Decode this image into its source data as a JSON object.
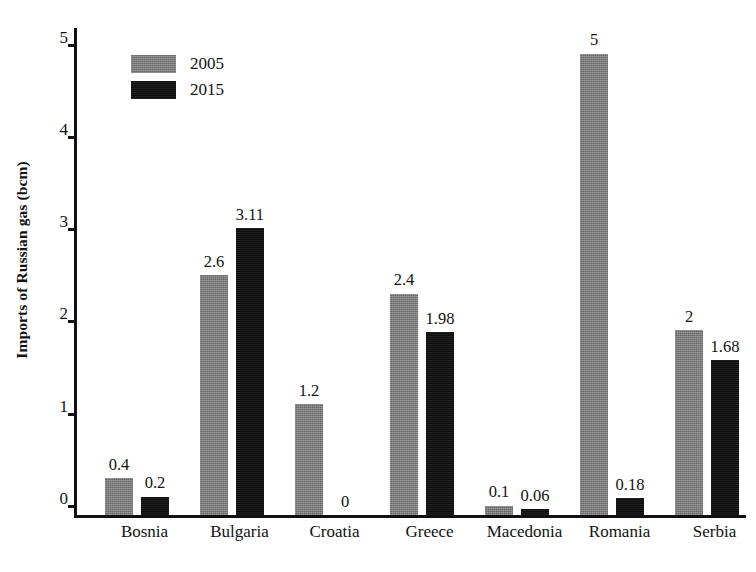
{
  "chart_data": {
    "type": "bar",
    "title": "",
    "subtitle": "",
    "xlabel": "",
    "ylabel": "Imports of Russian gas (bcm)",
    "categories": [
      "Bosnia",
      "Bulgaria",
      "Croatia",
      "Greece",
      "Macedonia",
      "Romania",
      "Serbia"
    ],
    "series": [
      {
        "name": "2005",
        "color": "#7d7d7d",
        "values": [
          0.4,
          2.6,
          1.2,
          2.4,
          0.1,
          5,
          2
        ],
        "labels": [
          "0.4",
          "2.6",
          "1.2",
          "2.4",
          "0.1",
          "5",
          "2"
        ]
      },
      {
        "name": "2015",
        "color": "#111111",
        "values": [
          0.2,
          3.11,
          0,
          1.98,
          0.06,
          0.18,
          1.68
        ],
        "labels": [
          "0.2",
          "3.11",
          "0",
          "1.98",
          "0.06",
          "0.18",
          "1.68"
        ]
      }
    ],
    "ylim": [
      0,
      5.3
    ],
    "yticks": [
      0,
      1,
      2,
      3,
      4,
      5
    ],
    "ytick_labels": [
      "0",
      "1",
      "2",
      "3",
      "4",
      "5"
    ],
    "grid": false,
    "legend_position": "top-left",
    "legend_entries": [
      "2005",
      "2015"
    ]
  }
}
